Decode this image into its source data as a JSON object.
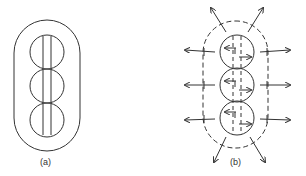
{
  "figure": {
    "panels": [
      {
        "id": "a",
        "label": "(a)",
        "description": "Three stacked circles inside a solid rounded enclosure with two vertical lines through the circles"
      },
      {
        "id": "b",
        "label": "(b)",
        "description": "Three stacked circles inside a dashed rounded enclosure with outward-pointing arrows and internal horizontal arrows"
      }
    ],
    "colors": {
      "stroke": "#333333",
      "background": "#ffffff"
    }
  }
}
